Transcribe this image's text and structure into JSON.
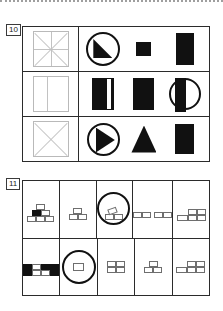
{
  "page": {
    "kind": "scanned-worksheet-fragment",
    "background": "#ffffff",
    "ink": "#111111",
    "rule_color": "#2b2b2b",
    "faint_color": "#b9b9b9"
  },
  "items": [
    {
      "number": "10",
      "name": "matrix-shape-item",
      "rows": [
        {
          "stem": {
            "icon": "square-with-cross-and-diagonals-icon",
            "fill": "outline"
          },
          "options": [
            {
              "icon": "circle-with-filled-quarter-wedge-icon",
              "fill": "part-filled"
            },
            {
              "icon": "small-filled-square-icon",
              "fill": "filled"
            },
            {
              "icon": "tall-filled-rectangle-icon",
              "fill": "filled"
            }
          ]
        },
        {
          "stem": {
            "icon": "square-with-vertical-line-icon",
            "fill": "outline"
          },
          "options": [
            {
              "icon": "filled-rectangle-with-white-stripe-icon",
              "fill": "part-filled"
            },
            {
              "icon": "filled-rectangle-icon",
              "fill": "filled"
            },
            {
              "icon": "circle-with-filled-left-half-icon",
              "fill": "half-filled"
            }
          ]
        },
        {
          "stem": {
            "icon": "square-with-x-icon",
            "fill": "outline"
          },
          "options": [
            {
              "icon": "circle-with-right-pointing-filled-triangle-icon",
              "fill": "part-filled"
            },
            {
              "icon": "filled-triangle-icon",
              "fill": "filled"
            },
            {
              "icon": "filled-rectangle-icon",
              "fill": "filled"
            }
          ]
        }
      ]
    },
    {
      "number": "11",
      "name": "brick-stack-item",
      "rows": [
        [
          {
            "icon": "brick-pyramid-3-2-1-icon",
            "marked": false,
            "filled_bricks": 1
          },
          {
            "icon": "brick-stack-2-1-icon",
            "marked": false,
            "filled_bricks": 0
          },
          {
            "icon": "brick-stack-2-plus-tilted-brick-icon",
            "marked": true,
            "filled_bricks": 0
          },
          {
            "icon": "two-brick-pairs-row-icon",
            "marked": false,
            "filled_bricks": 0
          },
          {
            "icon": "brick-row-1-plus-2x2-icon",
            "marked": false,
            "filled_bricks": 0
          }
        ],
        [
          {
            "icon": "brick-checker-pattern-icon",
            "marked": false,
            "filled_bricks": 3
          },
          {
            "icon": "single-brick-icon",
            "marked": true,
            "filled_bricks": 0
          },
          {
            "icon": "brick-block-2x2-icon",
            "marked": false,
            "filled_bricks": 0
          },
          {
            "icon": "brick-stack-2-1-icon",
            "marked": false,
            "filled_bricks": 0
          },
          {
            "icon": "brick-row-1-plus-2x2-icon",
            "marked": false,
            "filled_bricks": 0
          }
        ]
      ]
    }
  ]
}
